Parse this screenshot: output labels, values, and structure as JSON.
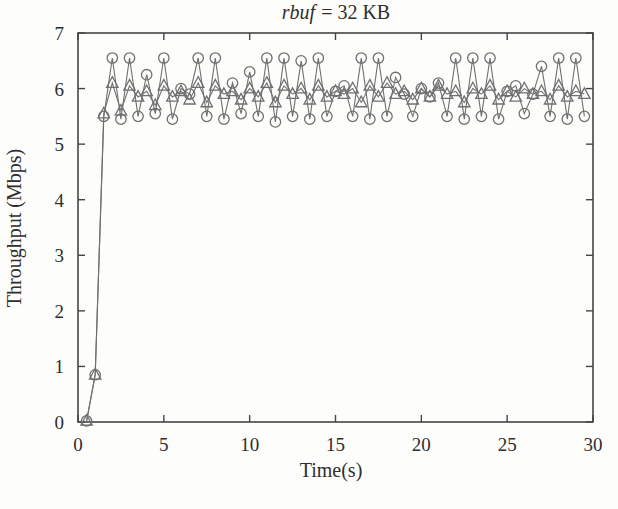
{
  "figure": {
    "background": "#fdfdfc"
  },
  "chart_data": {
    "type": "line",
    "title": {
      "text": "rbuf = 32 KB",
      "italic_part": "rbuf",
      "rest": "= 32 KB"
    },
    "xlabel": "Time(s)",
    "ylabel": "Throughput (Mbps)",
    "xlim": [
      0,
      30
    ],
    "ylim": [
      0,
      7
    ],
    "x_ticks": [
      0,
      5,
      10,
      15,
      20,
      25,
      30
    ],
    "y_ticks": [
      0,
      1,
      2,
      3,
      4,
      5,
      6,
      7
    ],
    "grid": false,
    "legend": "none",
    "frame": "box-with-mirrored-inward-ticks",
    "colors": {
      "series_line": "#6f6f6f",
      "frame": "#454545",
      "text": "#2e2e2e"
    },
    "x": [
      0.5,
      1,
      1.5,
      2,
      2.5,
      3,
      3.5,
      4,
      4.5,
      5,
      5.5,
      6,
      6.5,
      7,
      7.5,
      8,
      8.5,
      9,
      9.5,
      10,
      10.5,
      11,
      11.5,
      12,
      12.5,
      13,
      13.5,
      14,
      14.5,
      15,
      15.5,
      16,
      16.5,
      17,
      17.5,
      18,
      18.5,
      19,
      19.5,
      20,
      20.5,
      21,
      21.5,
      22,
      22.5,
      23,
      23.5,
      24,
      24.5,
      25,
      25.5,
      26,
      26.5,
      27,
      27.5,
      28,
      28.5,
      29,
      29.5
    ],
    "series": [
      {
        "name": "circle-marker-series",
        "marker": "circle",
        "values": [
          0.02,
          0.85,
          5.5,
          6.55,
          5.45,
          6.55,
          5.5,
          6.25,
          5.55,
          6.55,
          5.45,
          6.0,
          5.9,
          6.55,
          5.5,
          6.55,
          5.45,
          6.1,
          5.55,
          6.3,
          5.5,
          6.55,
          5.4,
          6.55,
          5.5,
          6.5,
          5.45,
          6.55,
          5.5,
          5.95,
          6.05,
          5.5,
          6.55,
          5.45,
          6.55,
          5.5,
          6.2,
          5.9,
          5.5,
          6.0,
          5.85,
          6.1,
          5.5,
          6.55,
          5.45,
          6.55,
          5.5,
          6.55,
          5.45,
          5.95,
          6.05,
          5.55,
          5.9,
          6.4,
          5.5,
          6.55,
          5.45,
          6.55,
          5.5
        ]
      },
      {
        "name": "triangle-marker-series",
        "marker": "triangle",
        "values": [
          0.02,
          0.85,
          5.55,
          6.1,
          5.6,
          6.05,
          5.85,
          5.95,
          5.7,
          6.05,
          5.85,
          5.95,
          5.8,
          6.1,
          5.75,
          6.05,
          5.9,
          5.95,
          5.8,
          6.0,
          5.85,
          6.1,
          5.75,
          6.05,
          5.9,
          6.0,
          5.8,
          6.05,
          5.85,
          5.95,
          5.9,
          6.0,
          5.75,
          6.05,
          5.85,
          6.1,
          5.9,
          5.95,
          5.8,
          6.0,
          5.85,
          6.05,
          5.9,
          5.95,
          5.75,
          6.0,
          5.9,
          6.05,
          5.8,
          5.95,
          5.85,
          6.0,
          5.9,
          5.95,
          5.8,
          6.05,
          5.85,
          5.95,
          5.9
        ]
      }
    ]
  }
}
